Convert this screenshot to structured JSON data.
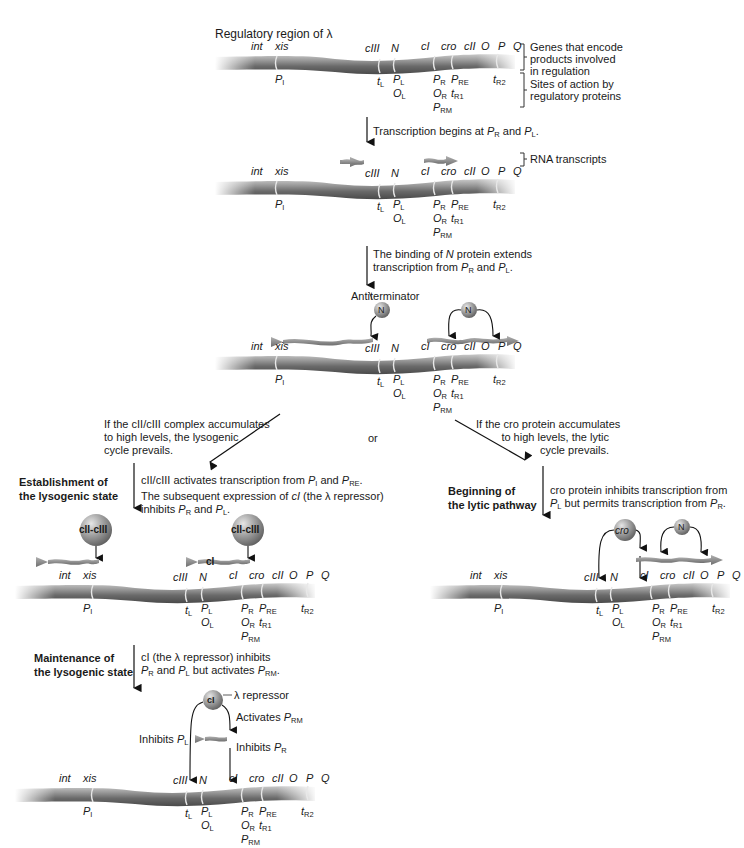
{
  "title": "Regulatory region of λ",
  "legend": {
    "genes": "Genes that encode products involved in regulation",
    "genes_lines": [
      "Genes that encode",
      "products involved",
      "in regulation"
    ],
    "sites_lines": [
      "Sites of action by",
      "regulatory proteins"
    ],
    "rna": "RNA transcripts"
  },
  "genes": [
    "int",
    "xis",
    "cIII",
    "N",
    "cI",
    "cro",
    "cII",
    "O",
    "P",
    "Q"
  ],
  "sites": {
    "PI": {
      "main": "P",
      "sub": "I"
    },
    "tL": {
      "main": "t",
      "sub": "L"
    },
    "PL": {
      "main": "P",
      "sub": "L"
    },
    "OL": {
      "main": "O",
      "sub": "L"
    },
    "PR": {
      "main": "P",
      "sub": "R"
    },
    "OR": {
      "main": "O",
      "sub": "R"
    },
    "PRM": {
      "main": "P",
      "sub": "RM"
    },
    "PRE": {
      "main": "P",
      "sub": "RE"
    },
    "tR1": {
      "main": "t",
      "sub": "R1"
    },
    "tR2": {
      "main": "t",
      "sub": "R2"
    }
  },
  "steps": {
    "step1": {
      "pre": "Transcription begins at ",
      "a": "P",
      "a_sub": "R",
      "mid": " and ",
      "b": "P",
      "b_sub": "L",
      "post": "."
    },
    "step2_line1_pre": "The binding of ",
    "step2_line1_it": "N",
    "step2_line1_post": " protein extends",
    "step2_line2": {
      "pre": "transcription from ",
      "a": "P",
      "a_sub": "R",
      "mid": " and ",
      "b": "P",
      "b_sub": "L",
      "post": "."
    },
    "antiterminator": "Antiterminator",
    "or": "or",
    "lysogenic_condition": [
      "If the cII/cIII complex accumulates",
      "to high levels, the lysogenic",
      "cycle prevails."
    ],
    "lytic_condition": [
      "If the cro protein accumulates",
      "to high levels, the lytic",
      "cycle prevails."
    ]
  },
  "lysogenic": {
    "heading": [
      "Establishment of",
      "the lysogenic state"
    ],
    "desc_line1": {
      "pre": "cII/cIII activates transcription from ",
      "a": "P",
      "a_sub": "I",
      "mid": " and ",
      "b": "P",
      "b_sub": "RE",
      "post": "."
    },
    "desc_line2_pre": "The subsequent expression of ",
    "desc_line2_it": "cI",
    "desc_line2_post": " (the λ repressor)",
    "desc_line3": {
      "pre": "inhibits ",
      "a": "P",
      "a_sub": "R",
      "mid": " and ",
      "b": "P",
      "b_sub": "L",
      "post": "."
    },
    "complex_label": "cII-cIII",
    "ci_transcript": "cI"
  },
  "lytic": {
    "heading": [
      "Beginning of",
      "the lytic pathway"
    ],
    "desc_line1": "cro protein inhibits transcription from",
    "desc_line2": {
      "a": "P",
      "a_sub": "L",
      "mid": " but permits transcription from ",
      "b": "P",
      "b_sub": "R",
      "post": "."
    },
    "cro_label": "cro",
    "n_label": "N"
  },
  "maintenance": {
    "heading": [
      "Maintenance of",
      "the lysogenic state"
    ],
    "desc_line1": "cI (the λ repressor) inhibits",
    "desc_line2": {
      "a": "P",
      "a_sub": "R",
      "mid": " and ",
      "b": "P",
      "b_sub": "L",
      "mid2": " but activates ",
      "c": "P",
      "c_sub": "RM",
      "post": "."
    },
    "repressor_label": "λ repressor",
    "ci_label": "cI",
    "activates": {
      "pre": "Activates ",
      "a": "P",
      "a_sub": "RM"
    },
    "inhibits_pl": {
      "pre": "Inhibits ",
      "a": "P",
      "a_sub": "L"
    },
    "inhibits_pr": {
      "pre": "Inhibits ",
      "a": "P",
      "a_sub": "R"
    }
  },
  "n_protein_label": "N",
  "colors": {
    "dna_dark": "#5a5a5a",
    "dna_mid": "#8a8a8a",
    "dna_light": "#b8b8b8",
    "protein_ball": "#9a9a9a",
    "transcript": "#8c8c8c",
    "text": "#1a1a1a"
  }
}
